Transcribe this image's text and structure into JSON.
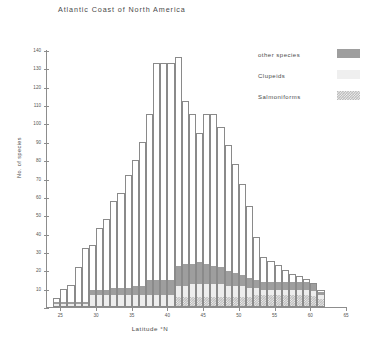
{
  "chart_data": {
    "type": "bar",
    "title": "Atlantic Coast of North America",
    "xlabel": "Latitude  °N",
    "ylabel": "No. of species",
    "xlim": [
      23,
      65
    ],
    "ylim": [
      0,
      140
    ],
    "ytick_step": 10,
    "yticks": [
      0,
      10,
      20,
      30,
      40,
      50,
      60,
      70,
      80,
      90,
      100,
      110,
      120,
      130,
      140
    ],
    "xticks": [
      25,
      30,
      35,
      40,
      45,
      50,
      55,
      60,
      65
    ],
    "grid": false,
    "legend_position": "top-right",
    "stacked": true,
    "bar_width_deg": 1,
    "legend": [
      "other species",
      "Clupeids",
      "Salmoniforms"
    ],
    "categories": [
      24,
      25,
      26,
      27,
      28,
      29,
      30,
      31,
      32,
      33,
      34,
      35,
      36,
      37,
      38,
      39,
      40,
      41,
      42,
      43,
      44,
      45,
      46,
      47,
      48,
      49,
      50,
      51,
      52,
      53,
      54,
      55,
      56,
      57,
      58,
      59,
      60,
      61
    ],
    "series": [
      {
        "name": "Salmoniforms",
        "color": "#b9b9b9",
        "pattern": "checker",
        "values": [
          0,
          0,
          0,
          0,
          0,
          0,
          0,
          0,
          0,
          0,
          0,
          0,
          0,
          0,
          0,
          0,
          0,
          5,
          5,
          5,
          5,
          5,
          5,
          5,
          5,
          5,
          5,
          5,
          6,
          6,
          6,
          6,
          6,
          6,
          6,
          6,
          6,
          6
        ]
      },
      {
        "name": "Clupeids",
        "color": "#ededed",
        "values": [
          1,
          1,
          1,
          1,
          1,
          6,
          6,
          6,
          6,
          6,
          6,
          6,
          6,
          6,
          6,
          6,
          6,
          6,
          6,
          7,
          7,
          7,
          7,
          7,
          6,
          6,
          6,
          5,
          4,
          3,
          3,
          3,
          3,
          3,
          3,
          3,
          3,
          3
        ]
      },
      {
        "name": "other species",
        "color": "#9e9e9e",
        "values": [
          1,
          1,
          1,
          1,
          1,
          3,
          3,
          3,
          4,
          4,
          4,
          5,
          5,
          8,
          8,
          8,
          8,
          11,
          12,
          11,
          12,
          11,
          10,
          9,
          8,
          7,
          6,
          5,
          4,
          4,
          4,
          4,
          4,
          4,
          4,
          4,
          4,
          3
        ]
      }
    ],
    "totals": [
      5,
      10,
      12,
      22,
      32,
      34,
      43,
      48,
      58,
      62,
      72,
      80,
      90,
      105,
      133,
      133,
      133,
      136,
      112,
      105,
      95,
      105,
      105,
      98,
      88,
      78,
      67,
      55,
      38,
      27,
      25,
      23,
      20,
      18,
      17,
      15,
      13,
      9
    ]
  },
  "legend": {
    "items": [
      {
        "label": "other species",
        "swatch": "sw-other"
      },
      {
        "label": "Clupeids",
        "swatch": "sw-clupeid"
      },
      {
        "label": "Salmoniforms",
        "swatch": "sw-salmon"
      }
    ]
  }
}
